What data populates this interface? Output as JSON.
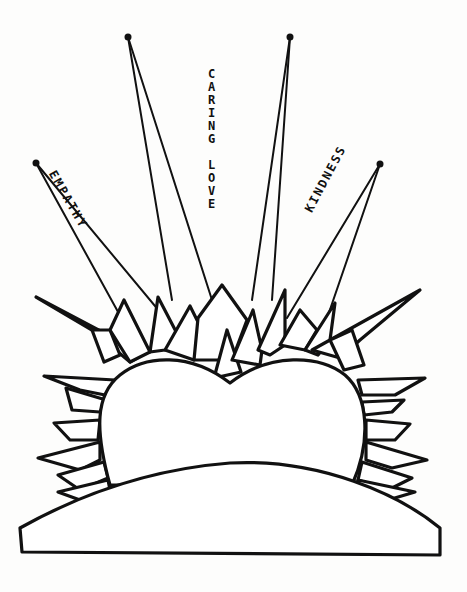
{
  "illustration": {
    "subject": "heart-shaped rising sun over hill with radiating rays",
    "ink_color": "#111111",
    "paper_color": "#fdfdfc",
    "labels": {
      "left": "EMPATHY",
      "center": "CARING LOVE",
      "right": "KINDNESS"
    }
  }
}
